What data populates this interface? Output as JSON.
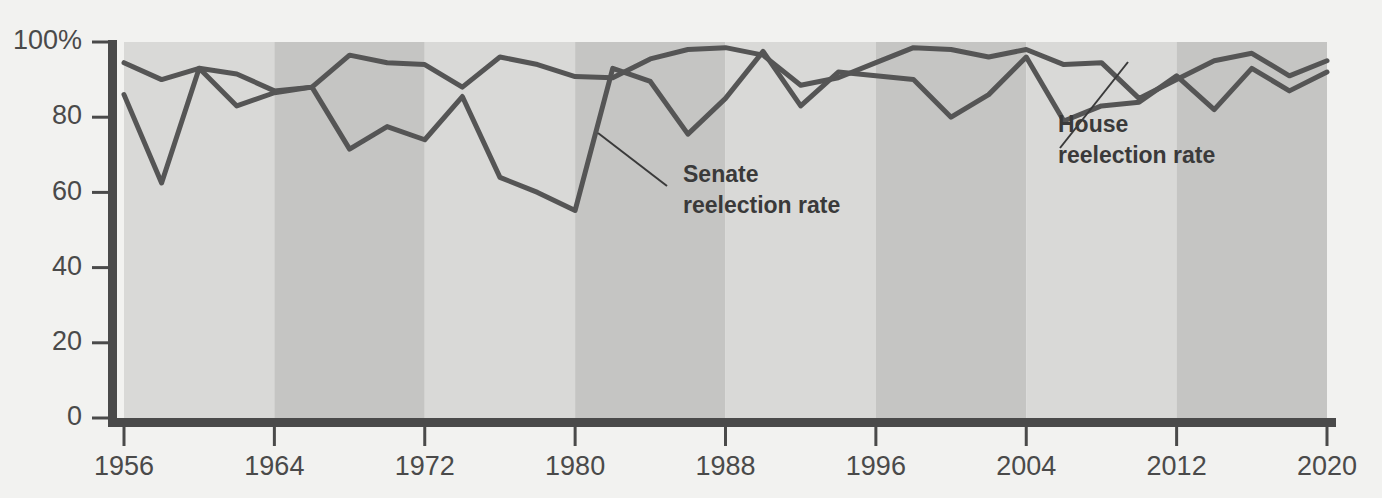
{
  "chart_data": {
    "type": "line",
    "title": "",
    "subtitle": "",
    "xlabel": "",
    "ylabel": "",
    "xlim": [
      1956,
      2020
    ],
    "ylim": [
      0,
      100
    ],
    "grid": false,
    "legend_position": "inline-annotations",
    "x_ticks": [
      "1956",
      "1964",
      "1972",
      "1980",
      "1988",
      "1996",
      "2004",
      "2012",
      "2020"
    ],
    "x_tick_values": [
      1956,
      1964,
      1972,
      1980,
      1988,
      1996,
      2004,
      2012,
      2020
    ],
    "y_ticks": [
      "0",
      "20",
      "40",
      "60",
      "80",
      "100%"
    ],
    "y_tick_values": [
      0,
      20,
      40,
      60,
      80,
      100
    ],
    "x": [
      1956,
      1958,
      1960,
      1962,
      1964,
      1966,
      1968,
      1970,
      1972,
      1974,
      1976,
      1978,
      1980,
      1982,
      1984,
      1986,
      1988,
      1990,
      1992,
      1994,
      1996,
      1998,
      2000,
      2002,
      2004,
      2006,
      2008,
      2010,
      2012,
      2014,
      2016,
      2018,
      2020
    ],
    "series": [
      {
        "name": "House reelection rate",
        "color": "#555555",
        "values": [
          94.5,
          90.0,
          93.0,
          91.5,
          87.0,
          88.0,
          96.5,
          94.5,
          94.0,
          88.0,
          96.0,
          94.0,
          90.8,
          90.5,
          95.5,
          98.0,
          98.5,
          96.5,
          88.5,
          90.5,
          94.5,
          98.5,
          98.0,
          96.0,
          98.0,
          94.0,
          94.5,
          85.0,
          90.0,
          95.0,
          97.0,
          91.0,
          95.0
        ]
      },
      {
        "name": "Senate reelection rate",
        "color": "#555555",
        "values": [
          86.0,
          62.5,
          93.0,
          83.0,
          86.5,
          88.0,
          71.5,
          77.5,
          74.0,
          85.5,
          64.0,
          60.0,
          55.2,
          93.0,
          89.5,
          75.5,
          85.0,
          97.5,
          83.0,
          92.0,
          91.0,
          90.0,
          80.0,
          86.0,
          96.0,
          79.0,
          83.0,
          84.0,
          91.0,
          82.0,
          93.0,
          87.0,
          92.0
        ]
      }
    ],
    "background_bands": [
      {
        "start": 1956,
        "end": 1964,
        "shade": "light"
      },
      {
        "start": 1964,
        "end": 1972,
        "shade": "dark"
      },
      {
        "start": 1972,
        "end": 1980,
        "shade": "light"
      },
      {
        "start": 1980,
        "end": 1988,
        "shade": "dark"
      },
      {
        "start": 1988,
        "end": 1996,
        "shade": "light"
      },
      {
        "start": 1996,
        "end": 2004,
        "shade": "dark"
      },
      {
        "start": 2004,
        "end": 2012,
        "shade": "light"
      },
      {
        "start": 2012,
        "end": 2020,
        "shade": "dark"
      }
    ],
    "annotations": [
      {
        "id": "senate",
        "line1": "Senate",
        "line2": "reelection rate",
        "text_x": 683,
        "text_y": 182,
        "leader": [
          [
            598,
            133
          ],
          [
            667,
            186
          ]
        ]
      },
      {
        "id": "house",
        "line1": "House",
        "line2": "reelection rate",
        "text_x": 1058,
        "text_y": 132,
        "leader": [
          [
            1128,
            62
          ],
          [
            1060,
            148
          ]
        ]
      }
    ]
  },
  "colors": {
    "page_background": "#f2f2f0",
    "band_light": "#d9d9d7",
    "band_dark": "#c5c5c3",
    "line": "#555555",
    "axis": "#4a4a4a",
    "text": "#4a4a4a",
    "annotation_text": "#3a3a3a"
  }
}
